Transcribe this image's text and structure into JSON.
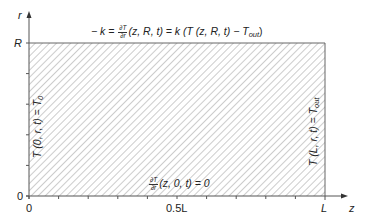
{
  "diagram": {
    "type": "boundary-condition-domain",
    "colors": {
      "axis": "#555555",
      "hatch": "#9a9a9a",
      "border": "#666666",
      "text": "#222222"
    },
    "axes": {
      "r_axis": {
        "label": "r",
        "ticks": {
          "R": "R",
          "zero": "0"
        }
      },
      "z_axis": {
        "label": "z",
        "ticks": {
          "zero": "0",
          "half": "0.5L",
          "end": "L"
        }
      }
    },
    "boundaries": {
      "top": {
        "prefix": "− k =",
        "frac_num": "∂T",
        "frac_den": "∂r",
        "mid": "(z, R, t) = k (T (z, R, t) − T",
        "sub": "out",
        "suffix": ")"
      },
      "bottom": {
        "frac_num": "∂T",
        "frac_den": "∂r",
        "rest": "(z, 0, t) = 0"
      },
      "left": {
        "main": "T (0, r, t) = T",
        "sub": "0"
      },
      "right": {
        "main": "T (L, r, t) = T",
        "sub": "out"
      }
    }
  }
}
